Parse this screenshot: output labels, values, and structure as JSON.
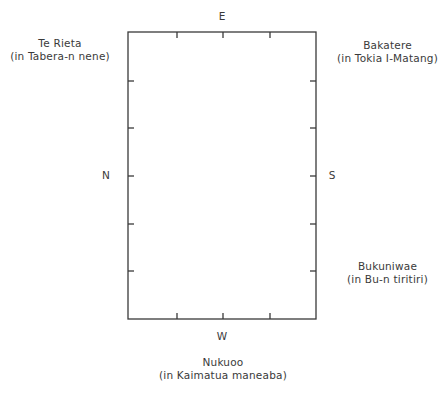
{
  "diagram": {
    "type": "orientation-plan",
    "frame": {
      "left": 128,
      "top": 32,
      "right": 316,
      "bottom": 319,
      "stroke": "#3a3a3a",
      "ticks_top_x": [
        177,
        223,
        270
      ],
      "ticks_bottom_x": [
        177,
        223,
        270
      ],
      "ticks_left_y": [
        81,
        128,
        176,
        224,
        271
      ],
      "ticks_right_y": [
        81,
        128,
        176,
        224,
        271
      ]
    },
    "directions": {
      "east": "E",
      "west": "W",
      "north": "N",
      "south": "S"
    },
    "corners": {
      "top_left": {
        "name": "Te Rieta",
        "location": "(in Tabera-n nene)"
      },
      "top_right": {
        "name": "Bakatere",
        "location": "(in Tokia I-Matang)"
      },
      "bottom_right": {
        "name": "Bukuniwae",
        "location": "(in Bu-n tiritiri)"
      },
      "bottom": {
        "name": "Nukuoo",
        "location": "(in Kaimatua maneaba)"
      }
    }
  }
}
